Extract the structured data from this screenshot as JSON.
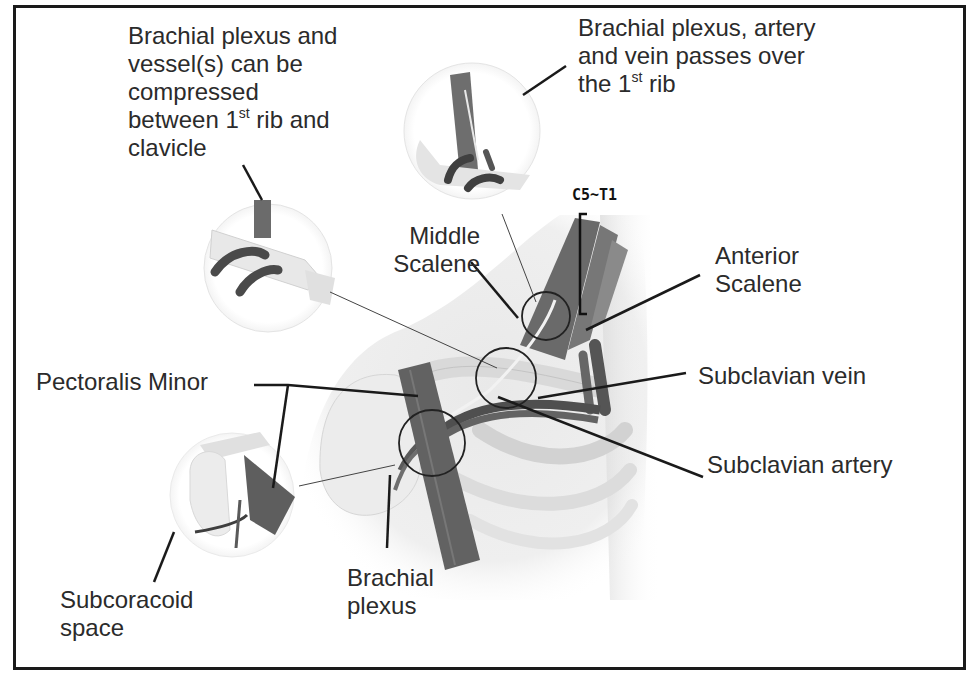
{
  "figure": {
    "type": "anatomical-diagram"
  },
  "labels": {
    "compression_note": {
      "line1": "Brachial plexus and",
      "line2": "vessel(s) can be",
      "line3": "compressed",
      "line4_pre": "between 1",
      "line4_sup": "st",
      "line4_post": " rib and",
      "line5": "clavicle"
    },
    "passes_over_note": {
      "line1": "Brachial plexus, artery",
      "line2": "and vein passes over",
      "line3_pre": "the 1",
      "line3_sup": "st",
      "line3_post": " rib"
    },
    "nerve_roots": "C5~T1",
    "middle_scalene": {
      "line1": "Middle",
      "line2": "Scalene"
    },
    "anterior_scalene": {
      "line1": "Anterior",
      "line2": "Scalene"
    },
    "pectoralis_minor": "Pectoralis Minor",
    "subclavian_vein": "Subclavian vein",
    "subclavian_artery": "Subclavian artery",
    "brachial_plexus": {
      "line1": "Brachial",
      "line2": "plexus"
    },
    "subcoracoid_space": {
      "line1": "Subcoracoid",
      "line2": "space"
    }
  },
  "insets": [
    {
      "name": "costoclavicular-space-inset",
      "cx": 268,
      "cy": 268,
      "r": 64
    },
    {
      "name": "interscalene-triangle-inset",
      "cx": 472,
      "cy": 131,
      "r": 68
    },
    {
      "name": "subcoracoid-space-inset",
      "cx": 232,
      "cy": 495,
      "r": 62
    }
  ],
  "callout_circles": [
    {
      "name": "interscalene-circle",
      "cx": 546,
      "cy": 316,
      "r": 24
    },
    {
      "name": "costoclavicular-circle",
      "cx": 506,
      "cy": 378,
      "r": 30
    },
    {
      "name": "subcoracoid-circle",
      "cx": 432,
      "cy": 443,
      "r": 33
    }
  ],
  "colors": {
    "muscle": "#6f6f6f",
    "muscle_dark": "#555555",
    "bone": "#e6e6e6",
    "vessel": "#4a4a4a",
    "line": "#1a1a1a"
  }
}
